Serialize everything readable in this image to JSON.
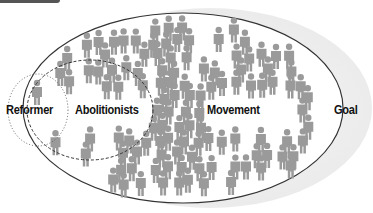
{
  "diagram": {
    "type": "nested-sets",
    "labels": {
      "reformer": "Reformer",
      "abolitionists": "Abolitionists",
      "movement": "Movement",
      "goal": "Goal"
    },
    "colors": {
      "person": "#9a9a9a",
      "goal_fill": "#ececec",
      "outline": "#333333",
      "text": "#111111"
    },
    "icon": "person-icon"
  }
}
